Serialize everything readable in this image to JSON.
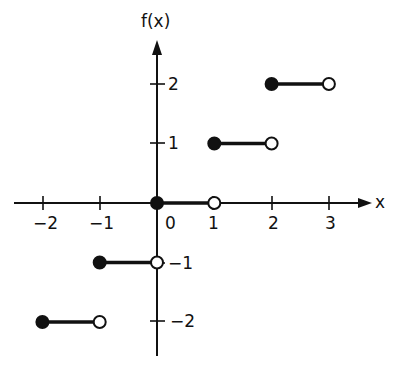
{
  "chart_data": {
    "type": "line",
    "subtype": "step",
    "title": "",
    "xlabel": "x",
    "ylabel": "f(x)",
    "xlim": [
      -2.3,
      3.7
    ],
    "ylim": [
      -2.6,
      2.8
    ],
    "x_ticks": [
      -2,
      -1,
      1,
      2,
      3
    ],
    "x_tick_labels": [
      "−2",
      "−1",
      "1",
      "2",
      "3"
    ],
    "origin_label": "0",
    "y_ticks": [
      2,
      1,
      -1,
      -2
    ],
    "y_tick_labels": [
      "2",
      "1",
      "−1",
      "−2"
    ],
    "grid": false,
    "legend": null,
    "series": [
      {
        "name": "f(x)",
        "segments": [
          {
            "x_start": -2,
            "x_end": -1,
            "y": -2,
            "start_closed": true,
            "end_closed": false
          },
          {
            "x_start": -1,
            "x_end": 0,
            "y": -1,
            "start_closed": true,
            "end_closed": false
          },
          {
            "x_start": 0,
            "x_end": 1,
            "y": 0,
            "start_closed": true,
            "end_closed": false
          },
          {
            "x_start": 1,
            "x_end": 2,
            "y": 1,
            "start_closed": true,
            "end_closed": false
          },
          {
            "x_start": 2,
            "x_end": 3,
            "y": 2,
            "start_closed": true,
            "end_closed": false
          }
        ]
      }
    ],
    "colors": {
      "line": "#111111",
      "background": "#ffffff"
    }
  },
  "labels": {
    "y_axis": "f(x)",
    "x_axis": "x",
    "origin": "0",
    "x_neg2": "−2",
    "x_neg1": "−1",
    "x_1": "1",
    "x_2": "2",
    "x_3": "3",
    "y_2": "2",
    "y_1": "1",
    "y_neg1": "−1",
    "y_neg2": "−2"
  }
}
